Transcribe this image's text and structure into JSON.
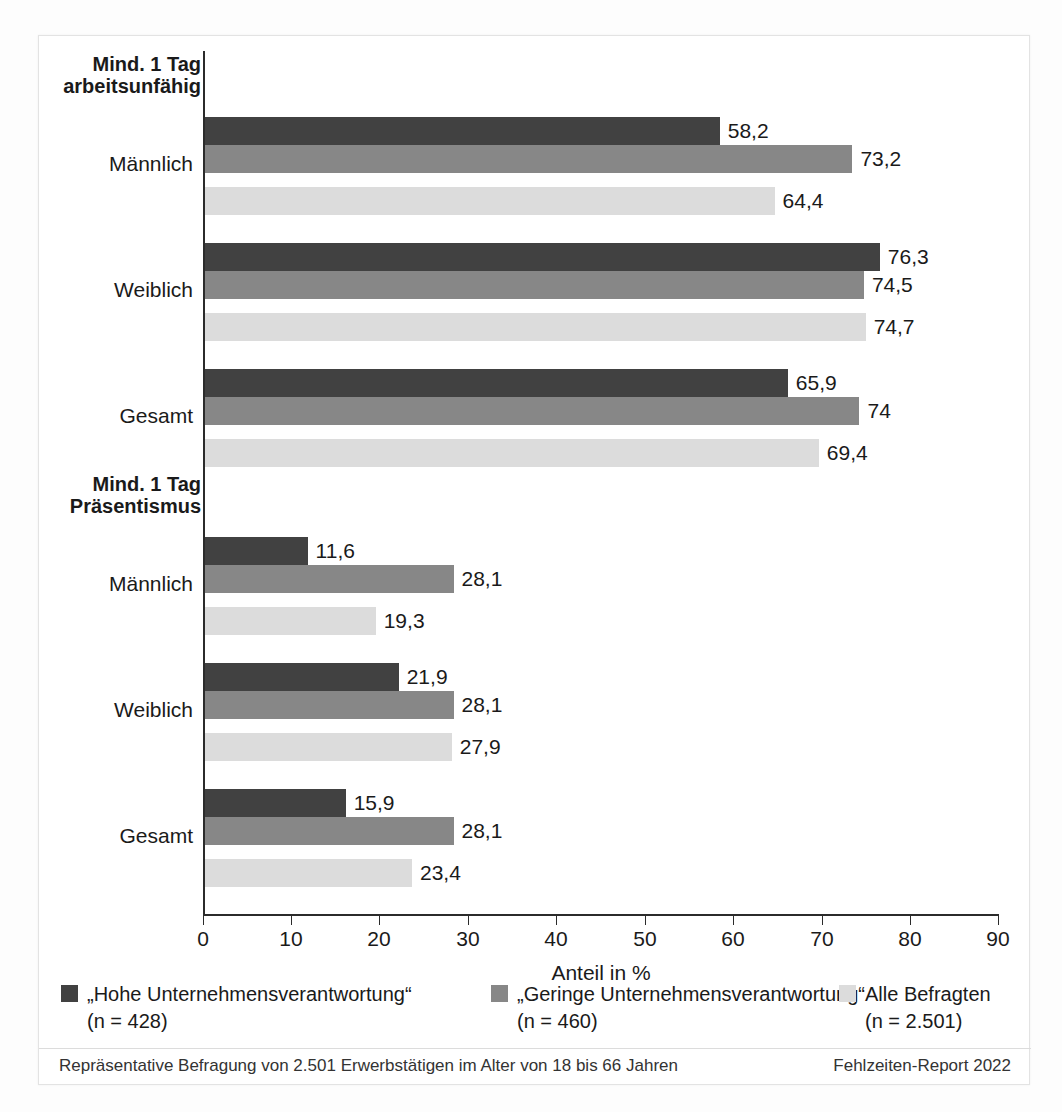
{
  "chart_data": {
    "type": "bar",
    "orientation": "horizontal",
    "title": "",
    "xlabel": "Anteil in %",
    "ylabel": "",
    "xlim": [
      0,
      90
    ],
    "xticks": [
      0,
      10,
      20,
      30,
      40,
      50,
      60,
      70,
      80,
      90
    ],
    "grid": false,
    "legend_position": "bottom",
    "sections": [
      {
        "header": "Mind. 1 Tag\narbeitsunfähig",
        "header_line1": "Mind. 1 Tag",
        "header_line2": "arbeitsunfähig",
        "groups": [
          {
            "label": "Männlich",
            "values": [
              58.2,
              73.2,
              64.4
            ],
            "labels": [
              "58,2",
              "73,2",
              "64,4"
            ]
          },
          {
            "label": "Weiblich",
            "values": [
              76.3,
              74.5,
              74.7
            ],
            "labels": [
              "76,3",
              "74,5",
              "74,7"
            ]
          },
          {
            "label": "Gesamt",
            "values": [
              65.9,
              74.0,
              69.4
            ],
            "labels": [
              "65,9",
              "74",
              "69,4"
            ]
          }
        ]
      },
      {
        "header": "Mind. 1 Tag\nPräsentismus",
        "header_line1": "Mind. 1 Tag",
        "header_line2": "Präsentismus",
        "groups": [
          {
            "label": "Männlich",
            "values": [
              11.6,
              28.1,
              19.3
            ],
            "labels": [
              "11,6",
              "28,1",
              "19,3"
            ]
          },
          {
            "label": "Weiblich",
            "values": [
              21.9,
              28.1,
              27.9
            ],
            "labels": [
              "21,9",
              "28,1",
              "27,9"
            ]
          },
          {
            "label": "Gesamt",
            "values": [
              15.9,
              28.1,
              23.4
            ],
            "labels": [
              "15,9",
              "28,1",
              "23,4"
            ]
          }
        ]
      }
    ],
    "series": [
      {
        "name": "„Hohe Unternehmensverantwortung“",
        "sub": "(n = 428)",
        "color": "#414141"
      },
      {
        "name": "„Geringe Unternehmensverantwortung“",
        "sub": "(n = 460)",
        "color": "#878787"
      },
      {
        "name": "Alle Befragten",
        "sub": "(n = 2.501)",
        "color": "#dcdcdc"
      }
    ]
  },
  "footer": {
    "left": "Repräsentative Befragung von 2.501 Erwerbstätigen im Alter von 18 bis 66 Jahren",
    "right": "Fehlzeiten-Report 2022"
  },
  "ticks": {
    "t0": "0",
    "t1": "10",
    "t2": "20",
    "t3": "30",
    "t4": "40",
    "t5": "50",
    "t6": "60",
    "t7": "70",
    "t8": "80",
    "t9": "90"
  }
}
